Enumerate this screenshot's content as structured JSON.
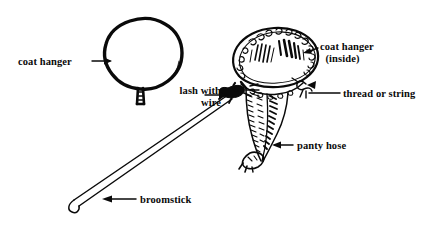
{
  "figure": {
    "background_color": "#ffffff",
    "ink_color": "#0a0a0a",
    "width": 446,
    "height": 231
  },
  "labels": {
    "coat_hanger_left": "coat hanger",
    "lash_with_wire_line1": "lash with",
    "lash_with_wire_line2": "wire",
    "coat_hanger_inside_line1": "coat hanger",
    "coat_hanger_inside_line2": "(inside)",
    "thread_or_string": "thread or string",
    "panty_hose": "panty hose",
    "broomstick": "broomstick"
  },
  "parts": {
    "hanger_loop": "coat-hanger-loop",
    "hanger_neck": "coat-hanger-twisted-neck",
    "hose_bag": "panty-hose-bag",
    "hose_tail": "panty-hose-gathered-tail",
    "lashing_knot": "wire-lashing-knot",
    "thread_bow": "thread-bow-knot",
    "broom_handle": "broomstick-handle"
  },
  "leaders": {
    "coat_hanger_left": "arrow-right",
    "lash_with_wire": "arrow-right",
    "coat_hanger_inside": "arrow-left",
    "thread_or_string": "plain-line",
    "panty_hose": "arrow-left",
    "broomstick": "arrow-left"
  }
}
